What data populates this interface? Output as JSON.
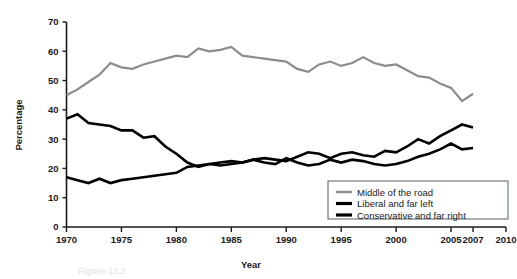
{
  "chart_data": {
    "type": "line",
    "title": "",
    "xlabel": "Year",
    "ylabel": "Percentage",
    "xlim": [
      1970,
      2010
    ],
    "ylim": [
      0,
      70
    ],
    "xticks": [
      1970,
      1975,
      1980,
      1985,
      1990,
      1995,
      2000,
      2005,
      2007,
      2010
    ],
    "xtick_labels": [
      "1970",
      "1975",
      "1980",
      "1985",
      "1990",
      "1995",
      "2000",
      "2005",
      "2007",
      "2010"
    ],
    "yticks": [
      0,
      10,
      20,
      30,
      40,
      50,
      60,
      70
    ],
    "ytick_labels": [
      "0",
      "10",
      "20",
      "30",
      "40",
      "50",
      "60",
      "70"
    ],
    "grid": false,
    "legend_position": "lower right",
    "x": [
      1970,
      1971,
      1972,
      1973,
      1974,
      1975,
      1976,
      1977,
      1978,
      1979,
      1980,
      1981,
      1982,
      1983,
      1984,
      1985,
      1986,
      1987,
      1988,
      1989,
      1990,
      1991,
      1992,
      1993,
      1994,
      1995,
      1996,
      1997,
      1998,
      1999,
      2000,
      2001,
      2002,
      2003,
      2004,
      2005,
      2006,
      2007
    ],
    "series": [
      {
        "name": "Middle of the road",
        "color": "#8c8c8c",
        "width": 2.2,
        "values": [
          45.0,
          47.0,
          49.5,
          52.0,
          56.0,
          54.5,
          54.0,
          55.5,
          56.5,
          57.5,
          58.5,
          58.0,
          61.0,
          60.0,
          60.5,
          61.5,
          58.5,
          58.0,
          57.5,
          57.0,
          56.5,
          54.0,
          53.0,
          55.5,
          56.5,
          55.0,
          56.0,
          58.0,
          56.0,
          55.0,
          55.5,
          53.5,
          51.5,
          51.0,
          49.0,
          47.5,
          43.0,
          45.5
        ]
      },
      {
        "name": "Liberal and far left",
        "color": "#000000",
        "width": 2.6,
        "values": [
          37.0,
          38.5,
          35.5,
          35.0,
          34.5,
          33.0,
          33.0,
          30.5,
          31.0,
          27.5,
          25.0,
          22.0,
          20.5,
          21.5,
          21.0,
          21.5,
          22.0,
          23.0,
          23.5,
          23.0,
          22.5,
          24.0,
          25.5,
          25.0,
          23.5,
          25.0,
          25.5,
          24.5,
          24.0,
          26.0,
          25.5,
          27.5,
          30.0,
          28.5,
          31.0,
          33.0,
          35.0,
          34.0
        ]
      },
      {
        "name": "Conservative and far right",
        "color": "#000000",
        "width": 2.6,
        "values": [
          17.0,
          16.0,
          15.0,
          16.5,
          15.0,
          16.0,
          16.5,
          17.0,
          17.5,
          18.0,
          18.5,
          20.5,
          21.0,
          21.5,
          22.0,
          22.5,
          22.0,
          23.0,
          22.0,
          21.5,
          23.5,
          22.0,
          21.0,
          21.5,
          23.0,
          22.0,
          23.0,
          22.5,
          21.5,
          21.0,
          21.5,
          22.5,
          24.0,
          25.0,
          26.5,
          28.5,
          26.5,
          27.0
        ]
      }
    ],
    "legend": [
      {
        "label": "Middle of the road",
        "color": "#8c8c8c"
      },
      {
        "label": "Liberal and far left",
        "color": "#000000"
      },
      {
        "label": "Conservative and far right",
        "color": "#000000"
      }
    ]
  },
  "figure": {
    "caption_partial": "Figure 12.2"
  }
}
